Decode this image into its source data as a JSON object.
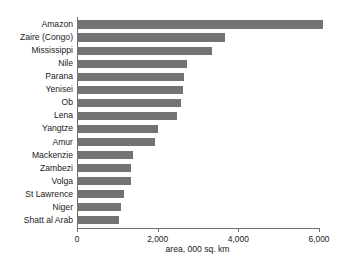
{
  "chart_data": {
    "type": "bar",
    "orientation": "horizontal",
    "title": "",
    "subtitle": "",
    "xlabel": "area, 000 sq. km",
    "ylabel": "",
    "xlim": [
      0,
      6500
    ],
    "xticks": [
      0,
      2000,
      4000,
      6000
    ],
    "xtick_labels": [
      "0",
      "2,000",
      "4,000",
      "6,000"
    ],
    "grid": false,
    "legend": null,
    "bar_color": "#737373",
    "axis_color": "#6e6e6e",
    "text_color": "#1a1a1a",
    "background": "#ffffff",
    "categories": [
      "Amazon",
      "Zaire (Congo)",
      "Mississippi",
      "Nile",
      "Parana",
      "Yenisei",
      "Ob",
      "Lena",
      "Yangtze",
      "Amur",
      "Mackenzie",
      "Zambezi",
      "Volga",
      "St Lawrence",
      "Niger",
      "Shatt al Arab"
    ],
    "values": [
      6100,
      3670,
      3350,
      2720,
      2650,
      2620,
      2570,
      2490,
      2000,
      1930,
      1400,
      1350,
      1330,
      1160,
      1080,
      1030
    ]
  }
}
